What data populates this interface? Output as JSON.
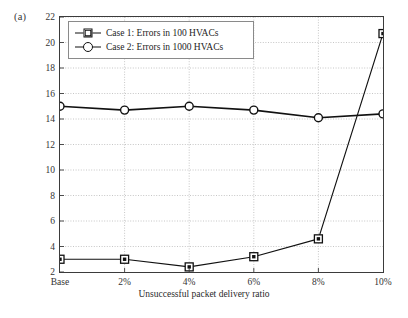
{
  "panel": {
    "label": "(a)"
  },
  "chart_data": {
    "type": "line",
    "title": "",
    "subtitle": "",
    "xlabel": "Unsuccessful packet delivery ratio",
    "ylabel": "Duration (min)",
    "categories": [
      "Base",
      "2%",
      "4%",
      "6%",
      "8%",
      "10%"
    ],
    "xtick_labels": [
      "Base",
      "2%",
      "4%",
      "6%",
      "8%",
      "10%"
    ],
    "ytick_labels": [
      "2",
      "4",
      "6",
      "8",
      "10",
      "12",
      "14",
      "16",
      "18",
      "20",
      "22"
    ],
    "yticks": [
      2,
      4,
      6,
      8,
      10,
      12,
      14,
      16,
      18,
      20,
      22
    ],
    "ylim": [
      2,
      22
    ],
    "xlim": [
      0,
      5
    ],
    "grid": true,
    "grid_style": "dotted",
    "legend_position": "upper-left",
    "series": [
      {
        "name": "Case 1: Errors in 100 HVACs",
        "marker": "square",
        "color": "#111111",
        "values": [
          3.0,
          3.0,
          2.4,
          3.2,
          4.6,
          20.7
        ]
      },
      {
        "name": "Case 2: Errors in 1000 HVACs",
        "marker": "circle",
        "color": "#111111",
        "values": [
          15.0,
          14.7,
          15.0,
          14.7,
          14.1,
          14.4
        ]
      }
    ]
  },
  "legend": {
    "items": [
      {
        "label": "Case 1: Errors in 100 HVACs",
        "marker": "square"
      },
      {
        "label": "Case 2: Errors in 1000 HVACs",
        "marker": "circle"
      }
    ]
  },
  "colors": {
    "axis": "#3b3b3b",
    "grid": "#b8b8b8",
    "series": "#111111",
    "background": "#ffffff",
    "text": "#231f20"
  }
}
